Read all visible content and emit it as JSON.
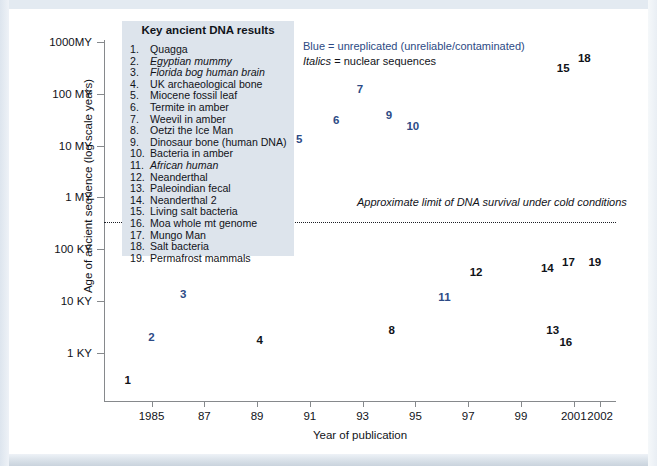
{
  "chart_data": {
    "type": "scatter",
    "title": "Key ancient DNA results",
    "xlabel": "Year of publication",
    "ylabel": "Age of ancient sequence (log scale years)",
    "grid": false,
    "xlim": [
      1983.2,
      2002.6
    ],
    "xticks": [
      {
        "value": 1985,
        "label": "1985"
      },
      {
        "value": 1987,
        "label": "87"
      },
      {
        "value": 1989,
        "label": "89"
      },
      {
        "value": 1991,
        "label": "91"
      },
      {
        "value": 1993,
        "label": "93"
      },
      {
        "value": 1995,
        "label": "95"
      },
      {
        "value": 1997,
        "label": "97"
      },
      {
        "value": 1999,
        "label": "99"
      },
      {
        "value": 2001,
        "label": "2001"
      },
      {
        "value": 2002,
        "label": "2002"
      }
    ],
    "yticks": [
      {
        "value": 1000000000,
        "label": "1000MY"
      },
      {
        "value": 100000000,
        "label": "100 MY"
      },
      {
        "value": 10000000,
        "label": "10 MY"
      },
      {
        "value": 1000000,
        "label": "1 MY"
      },
      {
        "value": 100000,
        "label": "100 KY"
      },
      {
        "value": 10000,
        "label": "10 KY"
      },
      {
        "value": 1000,
        "label": "1 KY"
      }
    ],
    "annotations": [
      {
        "name": "blue-key",
        "text": "Blue = unreplicated (unreliable/contaminated)",
        "color": "#2c4a84"
      },
      {
        "name": "italics-key",
        "text": "Italics = nuclear sequences",
        "color": "#111319"
      },
      {
        "name": "dna-survival-limit",
        "text": "Approximate limit of DNA survival under cold conditions",
        "color": "#111319"
      }
    ],
    "points": [
      {
        "id": 1,
        "label": "1",
        "name": "Quagga",
        "x": 1984.1,
        "y": 380,
        "color": "black",
        "italic": false
      },
      {
        "id": 2,
        "label": "2",
        "name": "Egyptian mummy",
        "x": 1985.0,
        "y": 337,
        "color": "blue",
        "italic": true
      },
      {
        "id": 3,
        "label": "3",
        "name": "Florida bog human brain",
        "x": 1986.2,
        "y": 294,
        "color": "blue",
        "italic": true
      },
      {
        "id": 4,
        "label": "4",
        "name": "UK archaeological bone",
        "x": 1989.1,
        "y": 340,
        "color": "black",
        "italic": false
      },
      {
        "id": 5,
        "label": "5",
        "name": "Miocene fossil leaf",
        "x": 1990.6,
        "y": 139,
        "color": "blue",
        "italic": false
      },
      {
        "id": 6,
        "label": "6",
        "name": "Termite in amber",
        "x": 1992.0,
        "y": 120,
        "color": "blue",
        "italic": false
      },
      {
        "id": 7,
        "label": "7",
        "name": "Weevil in amber",
        "x": 1992.9,
        "y": 89,
        "color": "blue",
        "italic": false
      },
      {
        "id": 8,
        "label": "8",
        "name": "Oetzi the Ice Man",
        "x": 1994.1,
        "y": 330,
        "color": "black",
        "italic": false
      },
      {
        "id": 9,
        "label": "9",
        "name": "Dinosaur bone (human DNA)",
        "x": 1994.0,
        "y": 115,
        "color": "blue",
        "italic": false
      },
      {
        "id": 10,
        "label": "10",
        "name": "Bacteria in amber",
        "x": 1994.9,
        "y": 126,
        "color": "blue",
        "italic": false
      },
      {
        "id": 11,
        "label": "11",
        "name": "African human",
        "x": 1996.1,
        "y": 297,
        "color": "blue",
        "italic": true
      },
      {
        "id": 12,
        "label": "12",
        "name": "Neanderthal",
        "x": 1997.3,
        "y": 272,
        "color": "black",
        "italic": false
      },
      {
        "id": 13,
        "label": "13",
        "name": "Paleoindian fecal",
        "x": 2000.2,
        "y": 330,
        "color": "black",
        "italic": false
      },
      {
        "id": 14,
        "label": "14",
        "name": "Neanderthal 2",
        "x": 2000.0,
        "y": 268,
        "color": "black",
        "italic": false
      },
      {
        "id": 15,
        "label": "15",
        "name": "Living salt bacteria",
        "x": 2000.6,
        "y": 68,
        "color": "black",
        "italic": false
      },
      {
        "id": 16,
        "label": "16",
        "name": "Moa whole mt genome",
        "x": 2000.7,
        "y": 342,
        "color": "black",
        "italic": false
      },
      {
        "id": 17,
        "label": "17",
        "name": "Mungo Man",
        "x": 2000.8,
        "y": 262,
        "color": "black",
        "italic": false
      },
      {
        "id": 18,
        "label": "18",
        "name": "Salt bacteria",
        "x": 2001.4,
        "y": 58,
        "color": "black",
        "italic": false
      },
      {
        "id": 19,
        "label": "19",
        "name": "Permafrost mammals",
        "x": 2001.8,
        "y": 262,
        "color": "black",
        "italic": false
      }
    ]
  }
}
